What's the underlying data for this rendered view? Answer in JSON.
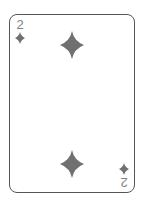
{
  "card": {
    "rank": "2",
    "suit": "diamonds",
    "suit_icon": "diamond-icon",
    "pip_color": "#707070",
    "border_color": "#555555",
    "index_color": "#808080"
  }
}
